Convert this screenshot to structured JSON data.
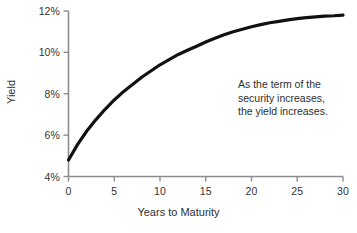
{
  "chart_data": {
    "type": "line",
    "title": "",
    "subtitle": "",
    "xlabel": "Years to Maturity",
    "ylabel": "Yield",
    "xlim": [
      0,
      30
    ],
    "ylim": [
      4,
      12
    ],
    "grid": false,
    "legend": false,
    "legend_position": "none",
    "xticks": [
      "0",
      "5",
      "10",
      "15",
      "20",
      "25",
      "30"
    ],
    "xtick_values": [
      0,
      5,
      10,
      15,
      20,
      25,
      30
    ],
    "yticks": [
      "4%",
      "6%",
      "8%",
      "10%",
      "12%"
    ],
    "ytick_values": [
      4,
      6,
      8,
      10,
      12
    ],
    "series": [
      {
        "name": "Yield curve",
        "color": "#111111",
        "line_width": 3.2,
        "x": [
          0,
          1,
          2,
          3,
          4,
          5,
          6,
          7,
          8,
          9,
          10,
          11,
          12,
          13,
          14,
          15,
          16,
          17,
          18,
          19,
          20,
          21,
          22,
          23,
          24,
          25,
          26,
          27,
          28,
          29,
          30
        ],
        "values": [
          4.8,
          5.55,
          6.2,
          6.75,
          7.25,
          7.7,
          8.1,
          8.45,
          8.8,
          9.1,
          9.4,
          9.65,
          9.9,
          10.1,
          10.3,
          10.5,
          10.68,
          10.85,
          11.0,
          11.12,
          11.24,
          11.34,
          11.43,
          11.5,
          11.57,
          11.63,
          11.68,
          11.72,
          11.75,
          11.77,
          11.8
        ]
      }
    ],
    "annotations": [
      {
        "name": "curve-annotation",
        "lines": [
          "As the term of the",
          "security increases,",
          "the yield increases."
        ],
        "x": 20,
        "y": 9.9
      }
    ],
    "axis_color": "#8c8c8c",
    "text_color": "#2e2e2e",
    "background": "#ffffff"
  }
}
